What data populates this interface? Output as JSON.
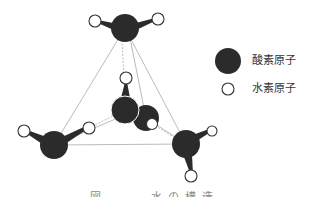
{
  "diagram": {
    "type": "molecular-structure",
    "colors": {
      "oxygen": "#2b2b2b",
      "hydrogen_fill": "#ffffff",
      "hydrogen_stroke": "#333333",
      "edge": "#aaaaaa"
    },
    "molecules": [
      {
        "id": "top",
        "oxygen": [
          125,
          28
        ],
        "hydrogens": [
          [
            95,
            21
          ],
          [
            158,
            19
          ]
        ]
      },
      {
        "id": "center",
        "oxygen": [
          125,
          110
        ],
        "hydrogens": [
          [
            126,
            78
          ]
        ]
      },
      {
        "id": "behind",
        "oxygen": [
          146,
          118
        ],
        "hydrogens": [
          [
            152,
            124
          ]
        ]
      },
      {
        "id": "left",
        "oxygen": [
          54,
          145
        ],
        "hydrogens": [
          [
            24,
            131
          ],
          [
            89,
            128
          ]
        ]
      },
      {
        "id": "right",
        "oxygen": [
          186,
          144
        ],
        "hydrogens": [
          [
            212,
            131
          ],
          [
            191,
            176
          ]
        ]
      }
    ]
  },
  "legend": {
    "items": [
      {
        "symbol": "oxygen-atom",
        "label": "酸素原子"
      },
      {
        "symbol": "hydrogen-atom",
        "label": "水素原子"
      }
    ]
  },
  "caption": {
    "text": "図 ── 水の構造"
  }
}
